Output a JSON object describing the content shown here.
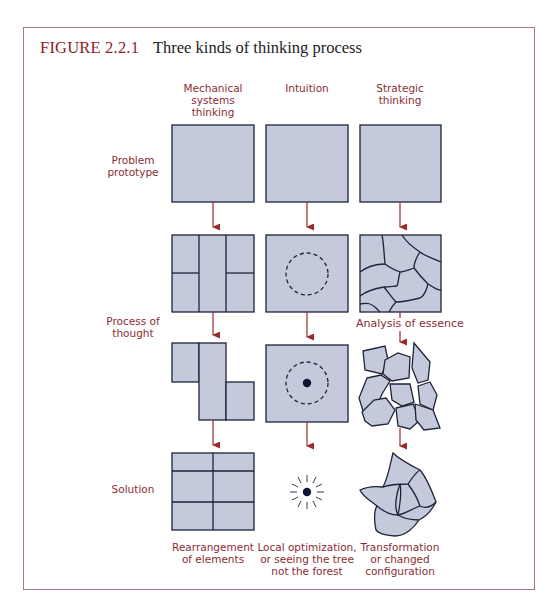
{
  "figure": {
    "number": "FIGURE 2.2.1",
    "title": "Three kinds of thinking process"
  },
  "columns": [
    {
      "id": "mechanical",
      "header_lines": [
        "Mechanical",
        "systems",
        "thinking"
      ],
      "outcome_lines": [
        "Rearrangement",
        "of elements"
      ]
    },
    {
      "id": "intuition",
      "header_lines": [
        "Intuition"
      ],
      "outcome_lines": [
        "Local optimization,",
        "or seeing the tree",
        "not the forest"
      ]
    },
    {
      "id": "strategic",
      "header_lines": [
        "Strategic",
        "thinking"
      ],
      "outcome_lines": [
        "Transformation",
        "or changed",
        "configuration"
      ]
    }
  ],
  "rows": [
    {
      "id": "problem",
      "label_lines": [
        "Problem",
        "prototype"
      ]
    },
    {
      "id": "process",
      "label_lines": [
        "Process of",
        "thought"
      ]
    },
    {
      "id": "solution",
      "label_lines": [
        "Solution"
      ]
    }
  ],
  "annotations": {
    "analysis": "Analysis of essence"
  },
  "colors": {
    "label_red": "#8b2c33",
    "arrow_red": "#9a2b2b",
    "box_fill": "#c4cadb",
    "box_stroke": "#1e2338",
    "frame": "#a07a7e"
  }
}
